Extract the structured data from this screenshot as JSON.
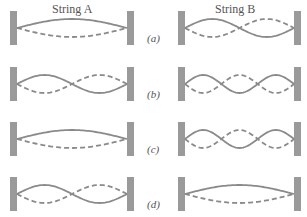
{
  "titles": {
    "left": "String A",
    "right": "String B"
  },
  "row_labels": [
    "(a)",
    "(b)",
    "(c)",
    "(d)"
  ],
  "colors": {
    "wall": "#9a9a9a",
    "wave": "#8a8a8a",
    "background": "#ffffff"
  },
  "rows": [
    {
      "label": "(a)",
      "string_a_loops": 1,
      "string_b_loops": 2
    },
    {
      "label": "(b)",
      "string_a_loops": 2,
      "string_b_loops": 3
    },
    {
      "label": "(c)",
      "string_a_loops": 1,
      "string_b_loops": 3
    },
    {
      "label": "(d)",
      "string_a_loops": 2,
      "string_b_loops": 1
    }
  ]
}
